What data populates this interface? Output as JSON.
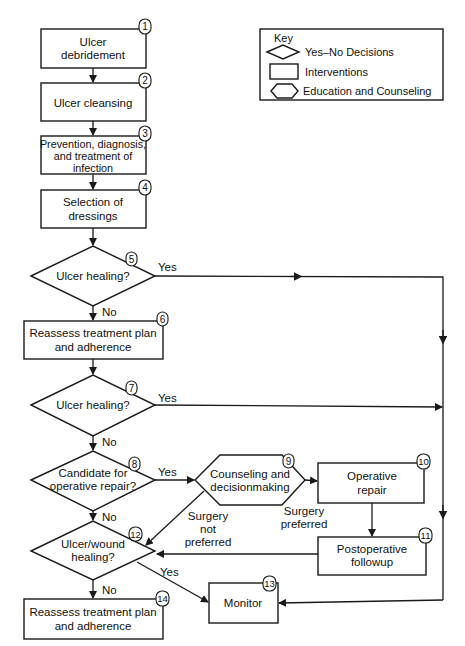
{
  "key": {
    "title": "Key",
    "items": [
      {
        "shape": "diamond",
        "label": "Yes–No Decisions"
      },
      {
        "shape": "rectangle",
        "label": "Interventions"
      },
      {
        "shape": "hexagon",
        "label": "Education and Counseling"
      }
    ]
  },
  "nodes": {
    "n1": {
      "num": "1",
      "type": "intervention",
      "lines": [
        "Ulcer",
        "debridement"
      ]
    },
    "n2": {
      "num": "2",
      "type": "intervention",
      "lines": [
        "Ulcer cleansing"
      ]
    },
    "n3": {
      "num": "3",
      "type": "intervention",
      "lines": [
        "Prevention, diagnosis,",
        "and treatment of",
        "infection"
      ]
    },
    "n4": {
      "num": "4",
      "type": "intervention",
      "lines": [
        "Selection of",
        "dressings"
      ]
    },
    "n5": {
      "num": "5",
      "type": "decision",
      "lines": [
        "Ulcer healing?"
      ]
    },
    "n6": {
      "num": "6",
      "type": "intervention",
      "lines": [
        "Reassess treatment plan",
        "and adherence"
      ]
    },
    "n7": {
      "num": "7",
      "type": "decision",
      "lines": [
        "Ulcer healing?"
      ]
    },
    "n8": {
      "num": "8",
      "type": "decision",
      "lines": [
        "Candidate for",
        "operative repair?"
      ]
    },
    "n9": {
      "num": "9",
      "type": "education",
      "lines": [
        "Counseling and",
        "decisionmaking"
      ]
    },
    "n10": {
      "num": "10",
      "type": "intervention",
      "lines": [
        "Operative",
        "repair"
      ]
    },
    "n11": {
      "num": "11",
      "type": "intervention",
      "lines": [
        "Postoperative",
        "followup"
      ]
    },
    "n12": {
      "num": "12",
      "type": "decision",
      "lines": [
        "Ulcer/wound",
        "healing?"
      ]
    },
    "n13": {
      "num": "13",
      "type": "intervention",
      "lines": [
        "Monitor"
      ]
    },
    "n14": {
      "num": "14",
      "type": "intervention",
      "lines": [
        "Reassess treatment plan",
        "and adherence"
      ]
    }
  },
  "edge_labels": {
    "n5_yes": "Yes",
    "n5_no": "No",
    "n7_yes": "Yes",
    "n7_no": "No",
    "n8_yes": "Yes",
    "n8_no": "No",
    "n9_pref": [
      "Surgery",
      "preferred"
    ],
    "n9_notpref": [
      "Surgery",
      "not",
      "preferred"
    ],
    "n12_yes": "Yes",
    "n12_no": "No"
  }
}
